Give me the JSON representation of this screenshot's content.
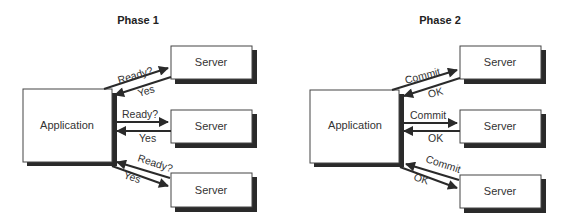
{
  "phases": [
    {
      "title": "Phase 1",
      "application": {
        "label": "Application"
      },
      "servers": [
        {
          "label": "Server",
          "request": "Ready?",
          "response": "Yes"
        },
        {
          "label": "Server",
          "request": "Ready?",
          "response": "Yes"
        },
        {
          "label": "Server",
          "request": "Ready?",
          "response": "Yes"
        }
      ]
    },
    {
      "title": "Phase 2",
      "application": {
        "label": "Application"
      },
      "servers": [
        {
          "label": "Server",
          "request": "Commit",
          "response": "OK"
        },
        {
          "label": "Server",
          "request": "Commit",
          "response": "OK"
        },
        {
          "label": "Server",
          "request": "Commit",
          "response": "OK"
        }
      ]
    }
  ],
  "colors": {
    "line": "#2a2a2a",
    "shadow": "#2a2a2a",
    "box_fill": "#ffffff"
  }
}
